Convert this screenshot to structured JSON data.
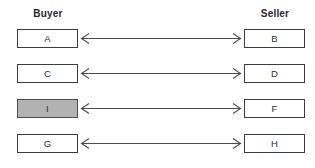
{
  "diagram": {
    "type": "bipartite-matching",
    "headers": {
      "left": "Buyer",
      "right": "Seller"
    },
    "colors": {
      "box_border": "#3a3d40",
      "box_fill": "#ffffff",
      "highlight_fill": "#b2b2b2",
      "arrow_stroke": "#4a4d50",
      "header_text": "#25282b",
      "background": "#ffffff"
    },
    "arrow": {
      "icon": "double-headed-arrow-icon",
      "direction": "bidirectional"
    },
    "rows": [
      {
        "index": 1,
        "left": {
          "label": "A",
          "highlighted": false
        },
        "right": {
          "label": "B",
          "highlighted": false
        },
        "connector": "bidirectional"
      },
      {
        "index": 2,
        "left": {
          "label": "C",
          "highlighted": false
        },
        "right": {
          "label": "D",
          "highlighted": false
        },
        "connector": "bidirectional"
      },
      {
        "index": 3,
        "left": {
          "label": "I",
          "highlighted": true
        },
        "right": {
          "label": "F",
          "highlighted": false
        },
        "connector": "bidirectional"
      },
      {
        "index": 4,
        "left": {
          "label": "G",
          "highlighted": false
        },
        "right": {
          "label": "H",
          "highlighted": false
        },
        "connector": "bidirectional"
      }
    ]
  }
}
